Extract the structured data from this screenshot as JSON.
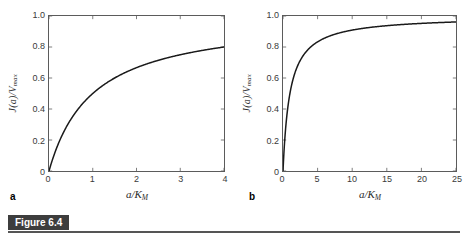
{
  "figure": {
    "caption_label": "Figure 6.4",
    "background_color": "#ffffff",
    "curve_color": "#1a1a1a",
    "axis_color": "#5b5b5b",
    "caption_box_color": "#3d3d3d"
  },
  "panels": [
    {
      "letter": "a",
      "xlabel": "a/K",
      "xlabel_sub": "M",
      "ylabel": "J(a)/V",
      "ylabel_sub": "max",
      "xticks": [
        "0",
        "1",
        "2",
        "3",
        "4"
      ],
      "yticks": [
        "1.0",
        "0.8",
        "0.6",
        "0.4",
        "0.2",
        "0"
      ]
    },
    {
      "letter": "b",
      "xlabel": "a/K",
      "xlabel_sub": "M",
      "ylabel": "J(a)/V",
      "ylabel_sub": "max",
      "xticks": [
        "0",
        "5",
        "10",
        "15",
        "20",
        "25"
      ],
      "yticks": [
        "1.0",
        "0.8",
        "0.6",
        "0.4",
        "0.2",
        "0"
      ]
    }
  ],
  "chart_data": [
    {
      "type": "line",
      "title": "",
      "panel": "a",
      "xlabel": "a/K_M",
      "ylabel": "J(a)/V_max",
      "xlim": [
        0,
        4
      ],
      "ylim": [
        0,
        1
      ],
      "xticks": [
        0,
        1,
        2,
        3,
        4
      ],
      "yticks": [
        0,
        0.2,
        0.4,
        0.6,
        0.8,
        1.0
      ],
      "grid": false,
      "legend": null,
      "equation": "J(a)/V_max = (a/K_M) / (1 + a/K_M)",
      "series": [
        {
          "name": "Michaelis-Menten saturation",
          "x": [
            0,
            0.1,
            0.2,
            0.3,
            0.4,
            0.5,
            0.6,
            0.8,
            1.0,
            1.2,
            1.4,
            1.6,
            1.8,
            2.0,
            2.25,
            2.5,
            2.75,
            3.0,
            3.25,
            3.5,
            3.75,
            4.0
          ],
          "values": [
            0,
            0.091,
            0.167,
            0.231,
            0.286,
            0.333,
            0.375,
            0.444,
            0.5,
            0.545,
            0.583,
            0.615,
            0.643,
            0.667,
            0.692,
            0.714,
            0.733,
            0.75,
            0.765,
            0.778,
            0.789,
            0.8
          ]
        }
      ]
    },
    {
      "type": "line",
      "title": "",
      "panel": "b",
      "xlabel": "a/K_M",
      "ylabel": "J(a)/V_max",
      "xlim": [
        0,
        25
      ],
      "ylim": [
        0,
        1
      ],
      "xticks": [
        0,
        5,
        10,
        15,
        20,
        25
      ],
      "yticks": [
        0,
        0.2,
        0.4,
        0.6,
        0.8,
        1.0
      ],
      "grid": false,
      "legend": null,
      "equation": "J(a)/V_max = (a/K_M) / (1 + a/K_M)",
      "series": [
        {
          "name": "Michaelis-Menten saturation",
          "x": [
            0,
            0.25,
            0.5,
            0.75,
            1.0,
            1.5,
            2.0,
            2.5,
            3.0,
            4.0,
            5.0,
            6.0,
            7.0,
            8.0,
            10.0,
            12.0,
            14.0,
            16.0,
            18.0,
            20.0,
            22.0,
            25.0
          ],
          "values": [
            0,
            0.2,
            0.333,
            0.429,
            0.5,
            0.6,
            0.667,
            0.714,
            0.75,
            0.8,
            0.833,
            0.857,
            0.875,
            0.889,
            0.909,
            0.923,
            0.933,
            0.941,
            0.947,
            0.952,
            0.957,
            0.962
          ]
        }
      ]
    }
  ]
}
